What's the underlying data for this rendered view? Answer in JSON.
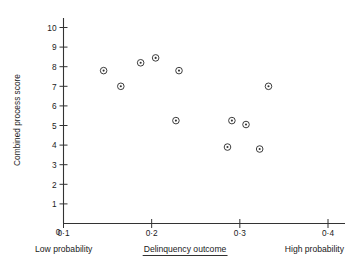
{
  "chart_data": {
    "type": "scatter",
    "title": "",
    "xlabel": "Delinquency outcome",
    "ylabel": "Combined process score",
    "xlim": [
      0.1,
      0.4
    ],
    "ylim": [
      0,
      10.5
    ],
    "grid": false,
    "legend": "none",
    "xticks": [
      {
        "value": 0.1,
        "label": "0·1"
      },
      {
        "value": 0.2,
        "label": "0·2"
      },
      {
        "value": 0.3,
        "label": "0·3"
      },
      {
        "value": 0.4,
        "label": "0·4"
      }
    ],
    "yticks": [
      {
        "value": 1,
        "label": "1"
      },
      {
        "value": 2,
        "label": "2"
      },
      {
        "value": 3,
        "label": "3"
      },
      {
        "value": 4,
        "label": "4"
      },
      {
        "value": 5,
        "label": "5"
      },
      {
        "value": 6,
        "label": "6"
      },
      {
        "value": 7,
        "label": "7"
      },
      {
        "value": 8,
        "label": "8"
      },
      {
        "value": 9,
        "label": "9"
      },
      {
        "value": 10,
        "label": "10"
      }
    ],
    "origin_label": "0",
    "x": [
      0.1455,
      0.165,
      0.1875,
      0.2045,
      0.2275,
      0.231,
      0.286,
      0.291,
      0.307,
      0.3225,
      0.3325
    ],
    "y": [
      7.8,
      7.0,
      8.2,
      8.45,
      5.25,
      7.8,
      3.9,
      5.25,
      5.05,
      3.8,
      7.0
    ],
    "points": [
      {
        "x": 0.1455,
        "y": 7.8
      },
      {
        "x": 0.165,
        "y": 7.0
      },
      {
        "x": 0.2045,
        "y": 8.45
      },
      {
        "x": 0.1875,
        "y": 8.2
      },
      {
        "x": 0.2275,
        "y": 5.25
      },
      {
        "x": 0.286,
        "y": 5.25
      },
      {
        "x": 0.291,
        "y": 5.05
      },
      {
        "x": 0.307,
        "y": 3.9
      },
      {
        "x": 0.3325,
        "y": 3.8
      }
    ],
    "marker": "circle-with-dot",
    "marker_color": "#333333",
    "annotations": [
      {
        "text": "Low probability",
        "position": "below-axis-left"
      },
      {
        "text": "Delinquency outcome",
        "position": "below-axis-center",
        "underlined": true
      },
      {
        "text": "High probability",
        "position": "below-axis-right"
      }
    ]
  },
  "captions": {
    "low": "Low probability",
    "center": "Delinquency outcome",
    "high": "High probability"
  },
  "axes": {
    "y_title": "Combined process score",
    "origin": "0"
  }
}
